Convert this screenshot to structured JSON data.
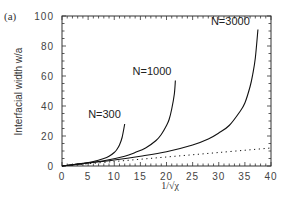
{
  "chart_data": {
    "type": "line",
    "panel_label": "(a)",
    "title": "",
    "xlabel": "1/√χ",
    "ylabel": "Interfacial width w/a",
    "xlim": [
      0,
      40
    ],
    "ylim": [
      0,
      100
    ],
    "xticks": [
      0,
      5,
      10,
      15,
      20,
      25,
      30,
      35,
      40
    ],
    "yticks": [
      0,
      20,
      40,
      60,
      80,
      100
    ],
    "ytick_labels": [
      "0",
      "20",
      "40",
      "60",
      "80",
      "100"
    ],
    "grid": false,
    "series": [
      {
        "name": "N=300",
        "style": "solid",
        "x": [
          0,
          2,
          4,
          6,
          8,
          9,
          10,
          10.5,
          11,
          11.5,
          12
        ],
        "y": [
          0,
          0.8,
          1.8,
          3,
          5,
          6.5,
          9,
          11,
          14,
          19,
          28
        ]
      },
      {
        "name": "N=1000",
        "style": "solid",
        "x": [
          0,
          4,
          8,
          12,
          14,
          16,
          18,
          19,
          20,
          20.5,
          21,
          21.5,
          21.7
        ],
        "y": [
          0,
          1.6,
          3.5,
          6.5,
          9,
          12,
          17,
          21,
          27,
          31,
          38,
          48,
          57
        ]
      },
      {
        "name": "N=3000",
        "style": "solid",
        "x": [
          0,
          5,
          10,
          15,
          20,
          25,
          28,
          30,
          32,
          34,
          35,
          36,
          36.5,
          37,
          37.5
        ],
        "y": [
          0,
          2,
          4,
          6.5,
          9.5,
          14,
          18,
          22,
          27,
          36,
          42,
          53,
          61,
          72,
          91
        ]
      },
      {
        "name": "asymptotic",
        "style": "dotted",
        "x": [
          0,
          10,
          20,
          30,
          40
        ],
        "y": [
          0,
          3,
          6,
          9,
          12
        ]
      }
    ],
    "annotations": [
      {
        "text": "N=300",
        "x": 5.0,
        "y": 32
      },
      {
        "text": "N=1000",
        "x": 13.5,
        "y": 61
      },
      {
        "text": "N=3000",
        "x": 28.5,
        "y": 94
      }
    ]
  },
  "labels": {
    "panel": "(a)",
    "ylabel": "Interfacial width w/a",
    "xlabel": "1/√χ"
  }
}
